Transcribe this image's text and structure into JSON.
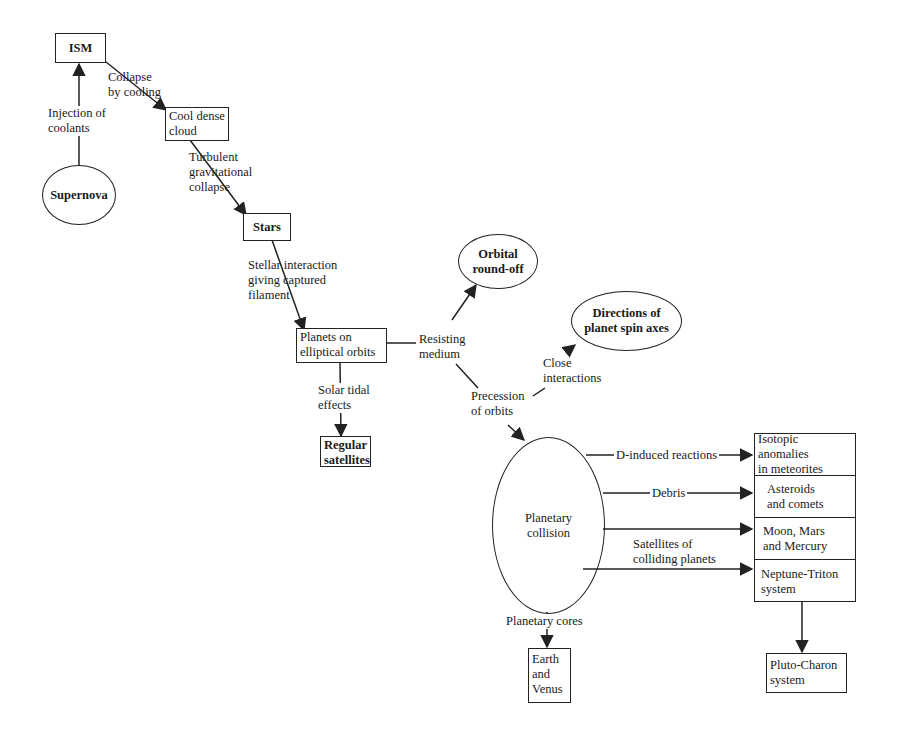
{
  "diagram": {
    "type": "flowchart",
    "nodes": {
      "ism": {
        "label": "ISM",
        "shape": "box"
      },
      "supernova": {
        "label": "Supernova",
        "shape": "ellipse"
      },
      "cool_dense_cloud": {
        "line1": "Cool dense",
        "line2": "cloud",
        "shape": "box"
      },
      "stars": {
        "label": "Stars",
        "shape": "box"
      },
      "planets_elliptical": {
        "line1": "Planets on",
        "line2": "elliptical orbits",
        "shape": "box"
      },
      "regular_satellites": {
        "line1": "Regular",
        "line2": "satellites",
        "shape": "box"
      },
      "orbital_roundoff": {
        "line1": "Orbital",
        "line2": "round-off",
        "shape": "ellipse"
      },
      "spin_axes": {
        "line1": "Directions of",
        "line2": "planet spin axes",
        "shape": "ellipse"
      },
      "planetary_collision": {
        "line1": "Planetary",
        "line2": "collision",
        "shape": "ellipse"
      },
      "isotopic": {
        "line1": "Isotopic anomalies",
        "line2": "in meteorites",
        "shape": "box"
      },
      "asteroids": {
        "line1": "Asteroids",
        "line2": "and comets",
        "shape": "box"
      },
      "moon_mars": {
        "line1": "Moon, Mars",
        "line2": "and Mercury",
        "shape": "box"
      },
      "neptune_triton": {
        "line1": "Neptune-Triton",
        "line2": "system",
        "shape": "box"
      },
      "pluto_charon": {
        "line1": "Pluto-Charon",
        "line2": "system",
        "shape": "box"
      },
      "earth_venus": {
        "line1": "Earth",
        "line2": "and",
        "line3": "Venus",
        "shape": "box"
      }
    },
    "edges": {
      "injection": {
        "line1": "Injection of",
        "line2": "coolants",
        "from": "Supernova",
        "to": "ISM"
      },
      "collapse_cooling": {
        "line1": "Collapse",
        "line2": "by cooling",
        "from": "ISM",
        "to": "Cool dense cloud"
      },
      "turbulent": {
        "line1": "Turbulent",
        "line2": "gravitational",
        "line3": "collapse",
        "from": "Cool dense cloud",
        "to": "Stars"
      },
      "stellar_interaction": {
        "line1": "Stellar interaction",
        "line2": "giving captured",
        "line3": "filament",
        "from": "Stars",
        "to": "Planets on elliptical orbits"
      },
      "solar_tidal": {
        "line1": "Solar tidal",
        "line2": "effects",
        "from": "Planets on elliptical orbits",
        "to": "Regular satellites"
      },
      "resisting_medium": {
        "line1": "Resisting",
        "line2": "medium",
        "from": "Planets on elliptical orbits",
        "to": "Orbital round-off"
      },
      "precession": {
        "line1": "Precession",
        "line2": "of orbits",
        "from": "Resisting medium",
        "to": "Planetary collision"
      },
      "close_interactions": {
        "line1": "Close",
        "line2": "interactions",
        "from": "Precession of orbits",
        "to": "Directions of planet spin axes"
      },
      "d_induced": {
        "label": "D-induced reactions",
        "from": "Planetary collision",
        "to": "Isotopic anomalies in meteorites"
      },
      "debris": {
        "label": "Debris",
        "from": "Planetary collision",
        "to": "Asteroids and comets"
      },
      "moon_edge": {
        "label": "",
        "from": "Planetary collision",
        "to": "Moon, Mars and Mercury"
      },
      "satellites_colliding": {
        "line1": "Satellites of",
        "line2": "colliding planets",
        "from": "Planetary collision",
        "to": "Neptune-Triton system"
      },
      "planetary_cores": {
        "label": "Planetary cores",
        "from": "Planetary collision",
        "to": "Earth and Venus"
      },
      "neptune_to_pluto": {
        "label": "",
        "from": "Neptune-Triton system",
        "to": "Pluto-Charon system"
      }
    }
  },
  "colors": {
    "line": "#222222",
    "background": "#ffffff",
    "text": "#1a1a1a"
  }
}
